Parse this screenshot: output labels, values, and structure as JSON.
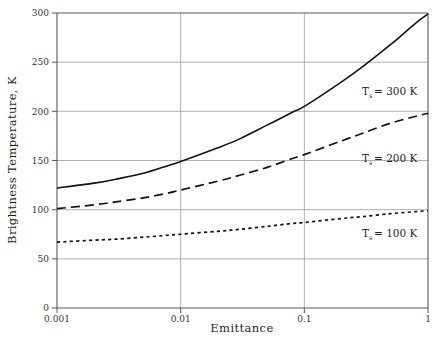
{
  "chart_data": {
    "type": "line",
    "title": "",
    "xlabel": "Emittance",
    "ylabel": "Brightness Temperature, K",
    "xscale": "log",
    "yscale": "linear",
    "xlim": [
      0.001,
      1
    ],
    "ylim": [
      0,
      300
    ],
    "xticks": [
      "0.001",
      "0.01",
      "0.1",
      "1"
    ],
    "xtick_values": [
      0.001,
      0.01,
      0.1,
      1
    ],
    "yticks": [
      "0",
      "50",
      "100",
      "150",
      "200",
      "250",
      "300"
    ],
    "ytick_values": [
      0,
      50,
      100,
      150,
      200,
      250,
      300
    ],
    "grid": true,
    "legend_position": "inline-annotations",
    "x": [
      0.001,
      0.002,
      0.003,
      0.005,
      0.008,
      0.01,
      0.02,
      0.03,
      0.05,
      0.08,
      0.1,
      0.2,
      0.3,
      0.5,
      0.8,
      1.0
    ],
    "series": [
      {
        "name": "Ts = 300 K",
        "label": "T",
        "sub": "s",
        "label_tail": "= 300 K",
        "style": "solid",
        "values": [
          122,
          127,
          131,
          137,
          145,
          149,
          163,
          172,
          186,
          199,
          205,
          230,
          246,
          268,
          290,
          299
        ]
      },
      {
        "name": "Ts = 200 K",
        "label": "T",
        "sub": "s",
        "label_tail": "= 200 K",
        "style": "dashed",
        "values": [
          101,
          105,
          108,
          112,
          117,
          120,
          129,
          135,
          143,
          152,
          156,
          170,
          178,
          188,
          195,
          198
        ]
      },
      {
        "name": "Ts = 100 K",
        "label": "T",
        "sub": "s",
        "label_tail": "= 100 K",
        "style": "dotted",
        "values": [
          67,
          69,
          70,
          72,
          74,
          75,
          78,
          80,
          83,
          86,
          87,
          91,
          93,
          96,
          98,
          99
        ]
      }
    ],
    "annotations": [
      {
        "text": "T",
        "sub": "s",
        "tail": "= 300 K",
        "x_px": 362,
        "y_px": 95
      },
      {
        "text": "T",
        "sub": "s",
        "tail": "= 200 K",
        "x_px": 362,
        "y_px": 162
      },
      {
        "text": "T",
        "sub": "s",
        "tail": "= 100 K",
        "x_px": 362,
        "y_px": 237
      }
    ]
  }
}
